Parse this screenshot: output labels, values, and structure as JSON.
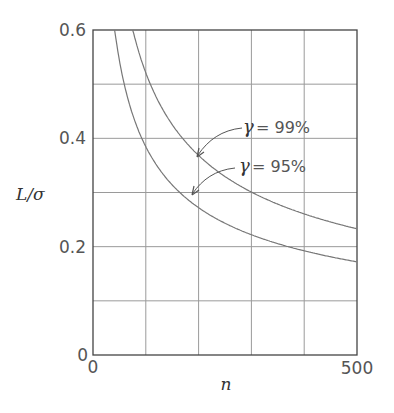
{
  "chart_data": {
    "type": "line",
    "title": "",
    "xlabel": "n",
    "ylabel": "L/σ",
    "xlim": [
      0,
      500
    ],
    "ylim": [
      0,
      0.6
    ],
    "grid": true,
    "x_ticks_labeled": [
      "0",
      "500"
    ],
    "x_gridlines": [
      100,
      200,
      300,
      400
    ],
    "y_ticks_labeled": [
      "0",
      "0.2",
      "0.4",
      "0.6"
    ],
    "y_gridlines": [
      0.1,
      0.2,
      0.3,
      0.4,
      0.5
    ],
    "series": [
      {
        "name": "γ = 99%",
        "x": [
          75,
          100,
          150,
          200,
          250,
          300,
          350,
          400,
          450,
          500
        ],
        "values": [
          0.6,
          0.52,
          0.425,
          0.368,
          0.329,
          0.3,
          0.278,
          0.26,
          0.245,
          0.233
        ]
      },
      {
        "name": "γ = 95%",
        "x": [
          41,
          50,
          100,
          150,
          200,
          250,
          300,
          350,
          400,
          450,
          500
        ],
        "values": [
          0.6,
          0.545,
          0.385,
          0.314,
          0.272,
          0.244,
          0.222,
          0.206,
          0.193,
          0.181,
          0.172
        ]
      }
    ],
    "annotations": [
      {
        "text": "γ = 99%",
        "points_to_series": "γ = 99%"
      },
      {
        "text": "γ = 95%",
        "points_to_series": "γ = 95%"
      }
    ],
    "legend": "none (inline annotations with arrows)"
  },
  "labels": {
    "y_axis": "L/σ",
    "x_axis": "n",
    "y_tick_0": "0",
    "y_tick_02": "0.2",
    "y_tick_04": "0.4",
    "y_tick_06": "0.6",
    "x_tick_0": "0",
    "x_tick_500": "500",
    "ann_99_symbol": "γ",
    "ann_99_value": "= 99%",
    "ann_95_symbol": "γ",
    "ann_95_value": "= 95%"
  }
}
